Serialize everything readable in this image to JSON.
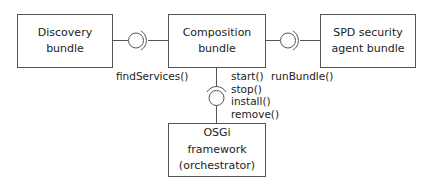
{
  "diagram": {
    "type": "component-diagram",
    "colors": {
      "line": "#555555",
      "text": "#222222",
      "background": "#ffffff"
    },
    "components": {
      "discovery": {
        "lines": [
          "Discovery",
          "bundle"
        ]
      },
      "composition": {
        "lines": [
          "Composition",
          "bundle"
        ]
      },
      "spd": {
        "lines": [
          "SPD security",
          "agent bundle"
        ]
      },
      "osgi": {
        "lines": [
          "OSGi",
          "framework",
          "(orchestrator)"
        ]
      }
    },
    "interfaces": {
      "discovery_composition": {
        "label": "findServices()",
        "from": "Discovery bundle",
        "to": "Composition bundle"
      },
      "composition_spd": {
        "label": "runBundle()",
        "from": "Composition bundle",
        "to": "SPD security agent bundle"
      },
      "composition_osgi": {
        "operations": [
          "start()",
          "stop()",
          "install()",
          "remove()"
        ],
        "from": "Composition bundle",
        "to": "OSGi framework (orchestrator)"
      }
    }
  }
}
